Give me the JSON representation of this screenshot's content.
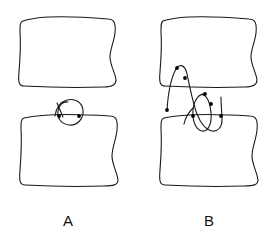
{
  "figure": {
    "background_color": "#ffffff",
    "stroke_color": "#1a1a1a",
    "dot_color": "#000000",
    "stroke_width": 1.1,
    "width": 274,
    "height": 246
  },
  "panels": [
    {
      "id": "A",
      "label": "A",
      "label_x": 68,
      "label_y": 220,
      "upper_box": {
        "name": "upper-box",
        "x": 18,
        "y": 17,
        "width": 99,
        "height": 69,
        "path": "M 23 21 C 40 15, 72 16, 108 19 C 114 19, 116 23, 115 33 C 114 42, 110 49, 110 57 C 110 65, 115 72, 116 80 C 116 85, 112 87, 104 87 C 74 88, 42 87, 24 86 C 19 86, 18 82, 19 72 C 20 60, 21 46, 20 32 C 20 25, 20 22, 23 21 Z"
      },
      "lower_box": {
        "name": "lower-box",
        "x": 18,
        "y": 114,
        "width": 101,
        "height": 72,
        "path": "M 24 118 C 45 113, 78 114, 110 116 C 116 116, 118 120, 117 130 C 116 140, 112 148, 112 156 C 112 164, 117 172, 118 180 C 118 185, 113 186, 104 186 C 74 187, 43 186, 25 185 C 20 185, 19 181, 20 170 C 21 157, 22 143, 21 129 C 21 122, 21 119, 24 118 Z"
      },
      "curves": [
        {
          "name": "crossing-loop",
          "path": "M 55 116 C 56 108, 60 102, 67 100 C 75 98, 82 102, 83 110 C 84 119, 77 126, 69 125 C 61 124, 57 118, 58 111 C 59 105, 63 101, 68 102",
          "description": "small closed loop straddling the top edge of the lower box"
        },
        {
          "name": "loop-tail",
          "path": "M 57 103 L 63 117",
          "description": "short crossing tail stroke at left of loop"
        }
      ],
      "dots": [
        {
          "name": "intersection-dot",
          "x": 59,
          "y": 116
        },
        {
          "name": "intersection-dot",
          "x": 79,
          "y": 116
        }
      ]
    },
    {
      "id": "B",
      "label": "B",
      "label_x": 209,
      "label_y": 220,
      "upper_box": {
        "name": "upper-box",
        "x": 158,
        "y": 17,
        "width": 100,
        "height": 69,
        "path": "M 163 21 C 180 15, 213 16, 249 19 C 255 19, 257 23, 256 33 C 255 42, 251 49, 251 57 C 251 65, 256 72, 257 80 C 257 85, 253 87, 245 87 C 215 88, 183 87, 165 86 C 160 86, 159 82, 160 72 C 161 60, 162 46, 161 32 C 161 25, 161 22, 163 21 Z"
      },
      "lower_box": {
        "name": "lower-box",
        "x": 158,
        "y": 114,
        "width": 101,
        "height": 72,
        "path": "M 164 118 C 185 113, 218 114, 250 116 C 256 116, 258 120, 257 130 C 256 140, 252 148, 252 156 C 252 164, 257 172, 258 180 C 258 185, 253 186, 244 186 C 214 187, 183 186, 165 185 C 160 185, 159 181, 160 170 C 161 157, 162 143, 161 129 C 161 122, 161 119, 164 118 Z"
      },
      "curves": [
        {
          "name": "main-crossing-curve",
          "path": "M 167 110 C 168 95, 171 78, 176 69 C 180 63, 185 65, 187 74 C 190 88, 193 104, 197 114 C 201 124, 206 130, 212 131 C 218 132, 222 127, 222 120 C 222 113, 221 106, 221 97",
          "description": "tall arch rising from lower-left, peaking above the upper box bottom edge, descending and hooking right"
        },
        {
          "name": "secondary-loop",
          "path": "M 206 94 C 199 93, 194 100, 193 110 C 192 121, 196 130, 202 131 C 208 132, 212 124, 211 113 C 210 103, 207 96, 203 95",
          "description": "narrow closed loop straddling the gap on the right half"
        },
        {
          "name": "loop-tail-b",
          "path": "M 193 108 C 188 113, 185 119, 184 124",
          "description": "short tail from the secondary loop"
        }
      ],
      "dots": [
        {
          "name": "curve-apex-dot",
          "x": 177,
          "y": 68
        },
        {
          "name": "curve-dot",
          "x": 185,
          "y": 78
        },
        {
          "name": "curve-endpoint-dot",
          "x": 167,
          "y": 110
        },
        {
          "name": "loop-top-dot",
          "x": 205,
          "y": 94
        },
        {
          "name": "loop-side-dot",
          "x": 211,
          "y": 104
        },
        {
          "name": "intersection-dot",
          "x": 193,
          "y": 116
        },
        {
          "name": "curve-endpoint-dot",
          "x": 221,
          "y": 116
        }
      ]
    }
  ]
}
